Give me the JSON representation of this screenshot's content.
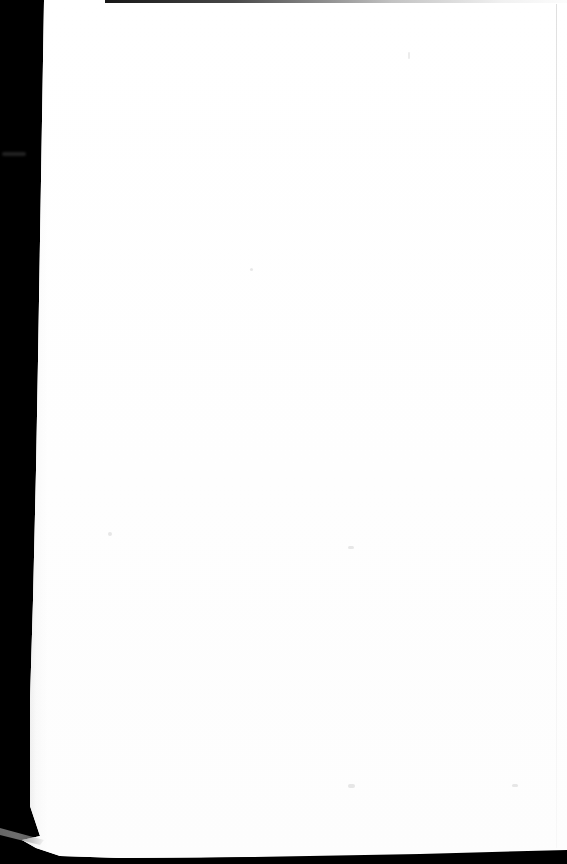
{
  "document": {
    "kind": "scanned-page-photograph",
    "page_content": "",
    "page_text_visible": "none",
    "description": "A blank white scanned page photographed against a solid black backdrop.",
    "orientation": "portrait",
    "width_px": 567,
    "height_px": 864
  },
  "page": {
    "label": "blank scanned page",
    "body_text": "",
    "header_text": "",
    "footer_text": "",
    "page_number": ""
  },
  "backdrop": {
    "label": "black backdrop",
    "color": "#000000"
  },
  "colors": {
    "backdrop": "#000000",
    "paper": "#ffffff",
    "paper_shadow": "#fdfdfd",
    "top_edge_line": "#0a0a0a",
    "right_edge_line": "#b4b4b4",
    "corner_sliver": "#8c8c8c",
    "speck": "#b4b4b4"
  },
  "artifacts": {
    "top_edge_line": "dark scan edge line along the top of the sheet",
    "right_edge_line": "faint grey vertical line near the right margin",
    "left_margin_band": "black backdrop band along the left, tapering downward",
    "bottom_strip": "black backdrop strip along the bottom",
    "corner_sliver": "grey diagonal sliver at the lower-left corner of the sheet",
    "backdrop_smudge": "small grey smudge on the backdrop at the upper left",
    "specks": "faint scan-noise specks on the paper"
  }
}
